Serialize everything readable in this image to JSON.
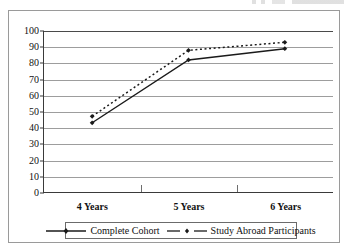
{
  "figure": {
    "top_fragment_note": ""
  },
  "chart_data": {
    "type": "line",
    "title": "",
    "xlabel": "",
    "ylabel": "",
    "categories": [
      "4 Years",
      "5 Years",
      "6 Years"
    ],
    "ylim": [
      0,
      100
    ],
    "yticks": [
      0,
      10,
      20,
      30,
      40,
      50,
      60,
      70,
      80,
      90,
      100
    ],
    "grid": true,
    "legend_position": "bottom",
    "series": [
      {
        "name": "Complete Cohort",
        "values": [
          43,
          82,
          89
        ],
        "line_style": "solid",
        "marker": "diamond",
        "color": "#1a1a1a"
      },
      {
        "name": "Study Abroad Participants",
        "values": [
          47,
          88,
          93
        ],
        "line_style": "dotted",
        "marker": "diamond",
        "color": "#1a1a1a"
      }
    ]
  }
}
